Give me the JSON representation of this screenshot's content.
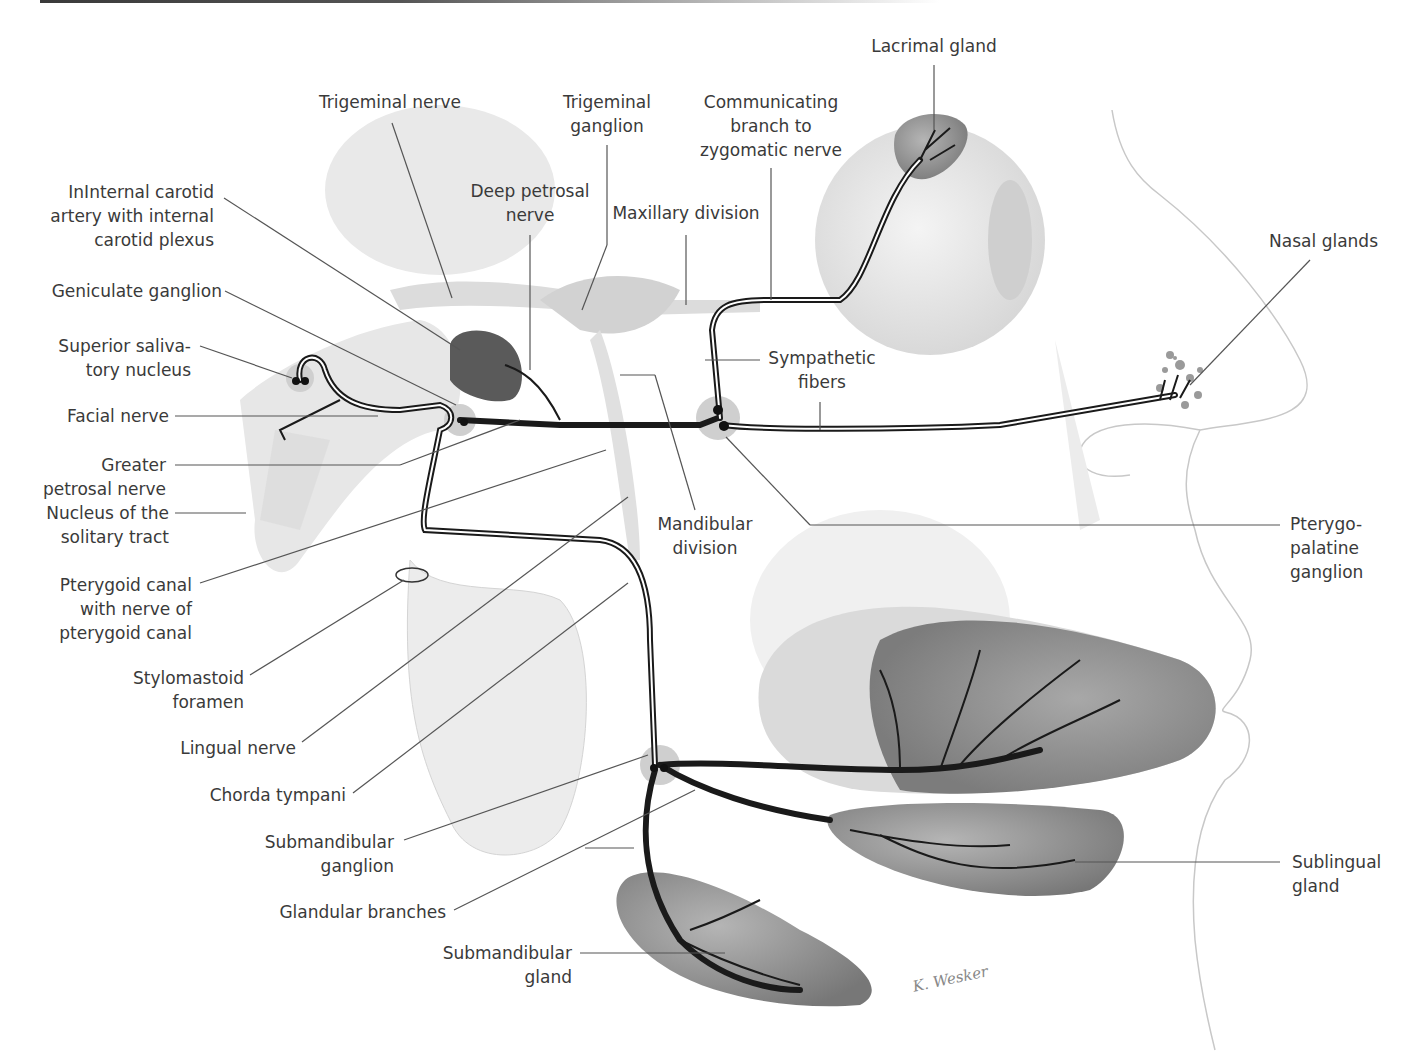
{
  "figure": {
    "signature": "K. Wesker",
    "colors": {
      "nerve": "#1a1a1a",
      "leader_line": "#555555",
      "label_text": "#3a3a3a",
      "gland_fill": "#8a8a8a",
      "background_anatomy": "#e6e6e6"
    }
  },
  "labels": {
    "lacrimal_gland": "Lacrimal gland",
    "trigeminal_nerve": "Trigeminal nerve",
    "trigeminal_ganglion": "Trigeminal\nganglion",
    "communicating_branch": "Communicating\nbranch to\nzygomatic nerve",
    "internal_carotid": "InInternal carotid\nartery with internal\ncarotid plexus",
    "deep_petrosal_nerve": "Deep petrosal\nnerve",
    "maxillary_division": "Maxillary division",
    "nasal_glands": "Nasal glands",
    "geniculate_ganglion": "Geniculate ganglion",
    "superior_salivatory_nucleus": "Superior saliva-\ntory nucleus",
    "sympathetic_fibers": "Sympathetic\nfibers",
    "facial_nerve": "Facial nerve",
    "greater_petrosal_nerve": "Greater\npetrosal nerve",
    "nucleus_solitary_tract": "Nucleus of the\nsolitary tract",
    "mandibular_division": "Mandibular\ndivision",
    "pterygopalatine_ganglion": "Pterygo-\npalatine\nganglion",
    "pterygoid_canal": "Pterygoid canal\nwith nerve of\npterygoid canal",
    "stylomastoid_foramen": "Stylomastoid\nforamen",
    "lingual_nerve": "Lingual nerve",
    "chorda_tympani": "Chorda tympani",
    "submandibular_ganglion": "Submandibular\nganglion",
    "sublingual_gland": "Sublingual\ngland",
    "glandular_branches": "Glandular branches",
    "submandibular_gland": "Submandibular\ngland"
  }
}
